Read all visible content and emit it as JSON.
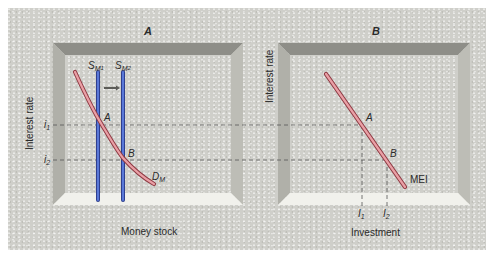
{
  "panels": [
    {
      "id": "A",
      "title": "A",
      "y_axis_label": "Interest rate",
      "x_axis_label": "Money stock",
      "y_ticks": [
        {
          "base": "i",
          "sub": "1"
        },
        {
          "base": "i",
          "sub": "2"
        }
      ],
      "curves": [
        {
          "name": "demand",
          "base": "D",
          "sub": "M",
          "color": "#d9737d"
        },
        {
          "name": "supply-1",
          "base": "S",
          "sub": "M",
          "sub2": "1",
          "color": "#4a63c7"
        },
        {
          "name": "supply-2",
          "base": "S",
          "sub": "M",
          "sub2": "2",
          "color": "#4a63c7"
        }
      ],
      "points": [
        "A",
        "B"
      ],
      "shift_arrow": "rightward shift of money supply"
    },
    {
      "id": "B",
      "title": "B",
      "y_axis_label": "Interest rate",
      "x_axis_label": "Investment",
      "x_ticks": [
        {
          "base": "I",
          "sub": "1"
        },
        {
          "base": "I",
          "sub": "2"
        }
      ],
      "curves": [
        {
          "name": "mei",
          "label": "MEI",
          "color": "#d9737d"
        }
      ],
      "points": [
        "A",
        "B"
      ]
    }
  ],
  "colors": {
    "background": "#cfcfca",
    "frame_top": "#8e8e88",
    "frame_side": "#b5b5ae",
    "frame_bottom": "#f1f1ec",
    "demand_curve": "#d9737d",
    "supply_curve": "#4a63c7",
    "dashed_line": "#555555"
  }
}
